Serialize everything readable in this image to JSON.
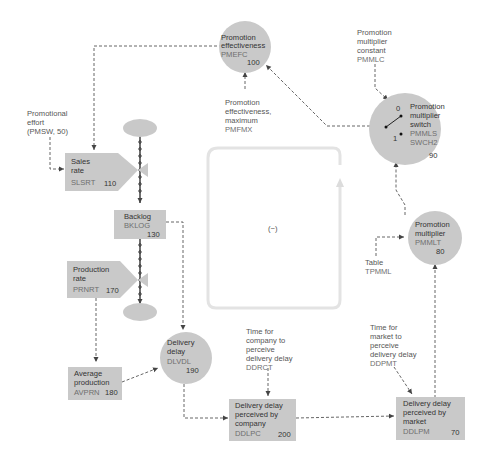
{
  "diagram": {
    "type": "system-dynamics-flow-diagram",
    "loop_polarity": "(−)",
    "nodes": {
      "promotional_effort": {
        "line1": "Promotional",
        "line2": "effort",
        "line3": "(PMSW, 50)"
      },
      "sales_rate": {
        "line1": "Sales",
        "line2": "rate",
        "code": "SLSRT",
        "number": "110"
      },
      "backlog": {
        "line1": "Backlog",
        "code": "BKLOG",
        "number": "130"
      },
      "production_rate": {
        "line1": "Production",
        "line2": "rate",
        "code": "PRNRT",
        "number": "170"
      },
      "average_production": {
        "line1": "Average",
        "line2": "production",
        "code": "AVPRN",
        "number": "180"
      },
      "delivery_delay": {
        "line1": "Delivery",
        "line2": "delay",
        "code": "DLVDL",
        "number": "190"
      },
      "time_company_perceive": {
        "line1": "Time for",
        "line2": "company to",
        "line3": "perceive",
        "line4": "delivery delay",
        "code": "DDRCT"
      },
      "delivery_delay_company": {
        "line1": "Delivery delay",
        "line2": "perceived by",
        "line3": "company",
        "code": "DDLPC",
        "number": "200"
      },
      "time_market_perceive": {
        "line1": "Time for",
        "line2": "market to",
        "line3": "perceive",
        "line4": "delivery delay",
        "code": "DDPMT"
      },
      "delivery_delay_market": {
        "line1": "Delivery delay",
        "line2": "perceived by",
        "line3": "market",
        "code": "DDLPM",
        "number": "70"
      },
      "promotion_multiplier": {
        "line1": "Promotion",
        "line2": "multiplier",
        "code": "PMMLT",
        "number": "80"
      },
      "table": {
        "line1": "Table",
        "code": "TPMML"
      },
      "promotion_multiplier_switch": {
        "line1": "Promotion",
        "line2": "multiplier",
        "line3": "switch",
        "code": "PMMLS",
        "code2": "SWCH2",
        "number": "90",
        "pos0": "0",
        "pos1": "1"
      },
      "promotion_multiplier_constant": {
        "line1": "Promotion",
        "line2": "multiplier",
        "line3": "constant",
        "code": "PMMLC"
      },
      "promotion_effectiveness": {
        "line1": "Promotion",
        "line2": "effectiveness",
        "code": "PMEFC",
        "number": "100"
      },
      "promotion_effectiveness_max": {
        "line1": "Promotion",
        "line2": "effectiveness,",
        "line3": "maximum",
        "code": "PMFMX"
      }
    },
    "colors": {
      "node_fill": "#c9c9c9",
      "link_stroke": "#555555",
      "loop_stroke": "#e3e3e3",
      "text": "#555555"
    }
  }
}
